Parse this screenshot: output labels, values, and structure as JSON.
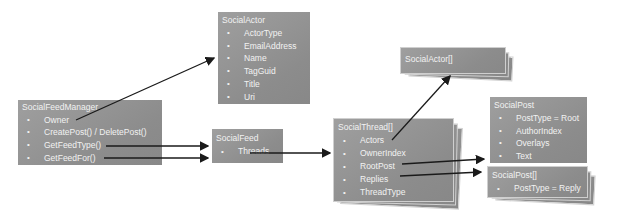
{
  "diagram": {
    "colors": {
      "background": "#ffffff",
      "box_fill_light": "#9f9f9f",
      "box_fill_dark": "#8c8c8c",
      "box_text": "#f2f2f2",
      "arrow": "#1a1a1a",
      "stack_edge": "#d2d2d2"
    },
    "icons": {
      "bullet": "•"
    },
    "nodes": [
      {
        "id": "social_feed_manager",
        "title": "SocialFeedManager",
        "items": [
          "Owner",
          "CreatePost() / DeletePost()",
          "GetFeedType()",
          "GetFeedFor()"
        ],
        "stacked": false
      },
      {
        "id": "social_actor",
        "title": "SocialActor",
        "items": [
          "ActorType",
          "EmailAddress",
          "Name",
          "TagGuid",
          "Title",
          "Uri"
        ],
        "stacked": false
      },
      {
        "id": "social_feed",
        "title": "SocialFeed",
        "items": [
          "Threads"
        ],
        "stacked": false
      },
      {
        "id": "social_thread_array",
        "title": "SocialThread[]",
        "items": [
          "Actors",
          "OwnerIndex",
          "RootPost",
          "Replies",
          "ThreadType"
        ],
        "stacked": true
      },
      {
        "id": "social_actor_array",
        "title": "SocialActor[]",
        "items": [],
        "stacked": true
      },
      {
        "id": "social_post",
        "title": "SocialPost",
        "items": [
          "PostType = Root",
          "AuthorIndex",
          "Overlays",
          "Text"
        ],
        "stacked": false
      },
      {
        "id": "social_post_array",
        "title": "SocialPost[]",
        "items": [
          "PostType = Reply"
        ],
        "stacked": true
      }
    ],
    "edges": [
      {
        "from": "SocialFeedManager.Owner",
        "to": "SocialActor"
      },
      {
        "from": "SocialFeedManager.GetFeedType()",
        "to": "SocialFeed"
      },
      {
        "from": "SocialFeedManager.GetFeedFor()",
        "to": "SocialFeed"
      },
      {
        "from": "SocialFeed.Threads",
        "to": "SocialThread[]"
      },
      {
        "from": "SocialThread[].Actors",
        "to": "SocialActor[]"
      },
      {
        "from": "SocialThread[].RootPost",
        "to": "SocialPost"
      },
      {
        "from": "SocialThread[].Replies",
        "to": "SocialPost[]"
      }
    ]
  }
}
